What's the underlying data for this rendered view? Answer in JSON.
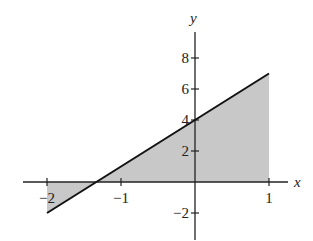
{
  "chart_data": {
    "type": "area",
    "title": "",
    "xlabel": "x",
    "ylabel": "y",
    "xlim": [
      -2.3,
      1.3
    ],
    "ylim": [
      -3.7,
      10.5
    ],
    "x_ticks": [
      -2,
      -1,
      1
    ],
    "x_tick_labels": [
      "−2",
      "−1",
      "1"
    ],
    "y_ticks": [
      -2,
      2,
      4,
      6,
      8
    ],
    "y_tick_labels": [
      "−2",
      "2",
      "4",
      "6",
      "8"
    ],
    "series": [
      {
        "name": "y = 3x + 4",
        "type": "line",
        "x": [
          -2,
          1
        ],
        "y": [
          -2,
          7
        ]
      }
    ],
    "shaded_region": {
      "description": "Region between line y = 3x + 4 and the x-axis for -2 <= x <= 1",
      "x_range": [
        -2,
        1
      ],
      "fill": "#c8c8c8"
    },
    "x_intercept": -1.333,
    "y_intercept": 4,
    "grid": false,
    "legend": null
  },
  "labels": {
    "x_axis": "x",
    "y_axis": "y",
    "x_ticks": [
      "−2",
      "−1",
      "1"
    ],
    "y_ticks": [
      "8",
      "6",
      "4",
      "2",
      "−2"
    ]
  },
  "colors": {
    "line": "#111111",
    "fill": "#c8c8c8",
    "axis": "#222222"
  }
}
